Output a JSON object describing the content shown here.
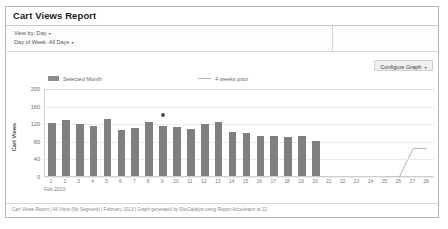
{
  "window": {
    "title": "Cart Views Report"
  },
  "filters": {
    "view_by_label": "View by: Day",
    "day_of_week_label": "Day of Week: All Days",
    "caret": "▾"
  },
  "toolbar": {
    "configure_graph_label": "Configure Graph",
    "caret": "▾"
  },
  "legend": {
    "selected_month": "Selected Month",
    "four_weeks_prior": "4 weeks prior"
  },
  "footer": {
    "text": "Cart Views Report | All Visits (No Segment) | February 2013 | Graph generated by SiteCatalyst using Report Accelerator at 12"
  },
  "chart_data": {
    "type": "bar",
    "title": "Cart Views Report",
    "xlabel": "Feb 2013",
    "ylabel": "Cart Views",
    "ylim": [
      0,
      200
    ],
    "yticks": [
      0,
      40,
      80,
      120,
      160,
      200
    ],
    "grid": true,
    "legend_position": "top",
    "month_label": "Feb 2013",
    "categories": [
      "1",
      "2",
      "3",
      "4",
      "5",
      "6",
      "7",
      "8",
      "9",
      "10",
      "11",
      "12",
      "13",
      "14",
      "15",
      "16",
      "17",
      "18",
      "19",
      "20",
      "21",
      "22",
      "23",
      "24",
      "25",
      "26",
      "27",
      "28"
    ],
    "series": [
      {
        "name": "Selected Month",
        "type": "bar",
        "color": "#7f7f7f",
        "values": [
          120,
          127,
          119,
          113,
          130,
          104,
          110,
          122,
          113,
          112,
          106,
          118,
          122,
          100,
          98,
          92,
          90,
          89,
          90,
          79,
          null,
          null,
          null,
          null,
          null,
          null,
          null,
          null
        ]
      },
      {
        "name": "4 weeks prior",
        "type": "line",
        "color": "#b6b6b6",
        "values": [
          null,
          null,
          null,
          null,
          null,
          null,
          null,
          null,
          null,
          null,
          null,
          null,
          null,
          null,
          null,
          null,
          null,
          null,
          null,
          null,
          null,
          null,
          null,
          null,
          0,
          0,
          65,
          65
        ]
      }
    ],
    "annotations": [
      {
        "name": "highlight-point",
        "x": "9",
        "y": 141,
        "color": "#4e4e4e"
      }
    ]
  }
}
